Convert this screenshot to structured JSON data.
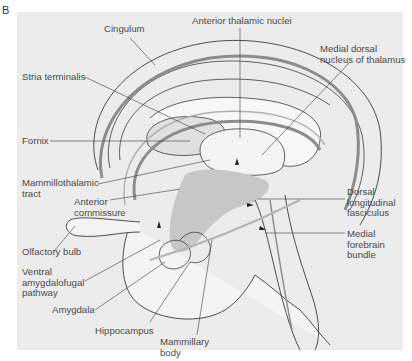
{
  "figure": {
    "panel_letter": "B",
    "colors": {
      "background_panel": "#ececec",
      "brain_fill": "#f4f4f4",
      "tract_dark": "#8c8c8c",
      "highlight_region": "#c7c7c7",
      "line": "#3a3a3a",
      "label_text": "#4a4a4a"
    },
    "labels": {
      "cingulum": "Cingulum",
      "anterior_thalamic_nuclei": "Anterior thalamic nuclei",
      "medial_dorsal_nucleus": "Medial dorsal\nnucleus of thalamus",
      "stria_terminalis": "Stria terminalis",
      "fornix": "Fornix",
      "mammillothalamic_tract": "Mammillothalamic\ntract",
      "anterior_commissure": "Anterior\ncommissure",
      "dorsal_longitudinal_fasciculus": "Dorsal\nlongitudinal\nfasciculus",
      "olfactory_bulb": "Olfactory bulb",
      "medial_forebrain_bundle": "Medial\nforebrain\nbundle",
      "ventral_amygdalofugal_pathway": "Ventral\namygdalofugal\npathway",
      "amygdala": "Amygdala",
      "hippocampus": "Hippocampus",
      "mammillary_body": "Mammillary\nbody"
    }
  }
}
